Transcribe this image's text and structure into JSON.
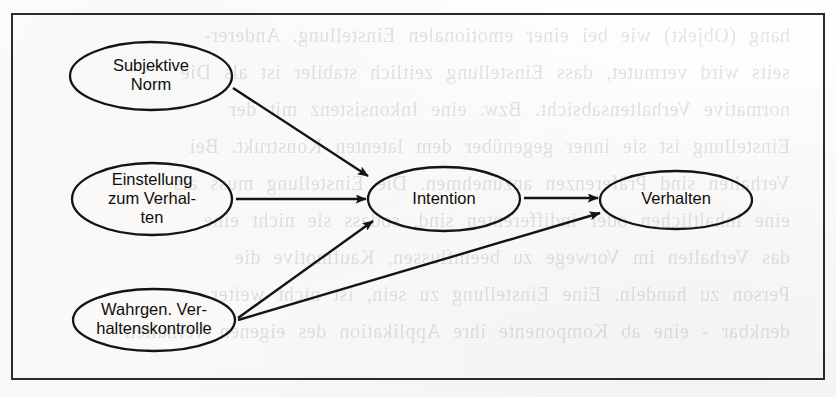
{
  "figure": {
    "kind": "concept-diagram",
    "language": "de",
    "frame": {
      "x": 11,
      "y": 13,
      "width": 814,
      "height": 367,
      "border_color": "#2a2a2a",
      "border_width": 2
    },
    "ink_color": "#141414",
    "paper_color": "#fdfdfc"
  },
  "nodes": [
    {
      "id": "subjektive-norm",
      "lines": [
        "Subjektive",
        "Norm"
      ],
      "cx": 151,
      "cy": 76,
      "rx": 81,
      "ry": 34,
      "label_line_height": 19
    },
    {
      "id": "einstellung",
      "lines": [
        "Einstellung",
        "zum Verhal-",
        "ten"
      ],
      "cx": 152,
      "cy": 199,
      "rx": 80,
      "ry": 36,
      "label_line_height": 19
    },
    {
      "id": "verhaltenskontrolle",
      "lines": [
        "Wahrgen. Ver-",
        "haltenskontrolle"
      ],
      "cx": 154,
      "cy": 320,
      "rx": 81,
      "ry": 31,
      "label_line_height": 19
    },
    {
      "id": "intention",
      "lines": [
        "Intention"
      ],
      "cx": 444,
      "cy": 199,
      "rx": 76,
      "ry": 32,
      "label_line_height": 19
    },
    {
      "id": "verhalten",
      "lines": [
        "Verhalten"
      ],
      "cx": 676,
      "cy": 200,
      "rx": 76,
      "ry": 29,
      "label_line_height": 19
    }
  ],
  "edges": [
    {
      "id": "norm-to-intention",
      "from": "subjektive-norm",
      "to": "intention",
      "x1": 233,
      "y1": 88,
      "x2": 368,
      "y2": 176
    },
    {
      "id": "einstellung-to-intention",
      "from": "einstellung",
      "to": "intention",
      "x1": 236,
      "y1": 199,
      "x2": 366,
      "y2": 199
    },
    {
      "id": "kontrolle-to-intention",
      "from": "verhaltenskontrolle",
      "to": "intention",
      "x1": 238,
      "y1": 318,
      "x2": 373,
      "y2": 221
    },
    {
      "id": "intention-to-verhalten",
      "from": "intention",
      "to": "verhalten",
      "x1": 524,
      "y1": 198,
      "x2": 598,
      "y2": 198
    },
    {
      "id": "kontrolle-to-verhalten",
      "from": "verhaltenskontrolle",
      "to": "verhalten",
      "x1": 238,
      "y1": 320,
      "x2": 600,
      "y2": 213
    }
  ],
  "ghost_text": {
    "note": "faint mirrored show-through from the reverse page",
    "opacity": 0.105,
    "lines": [
      {
        "text": "hang (Objekt) wie bei einer emotionalen Einstellung. Anderer-",
        "x": 46,
        "y": 24
      },
      {
        "text": "seits wird vermutet, dass Einstellung zeitlich stabiler ist als Die",
        "x": 46,
        "y": 61
      },
      {
        "text": "normative Verhaltensabsicht. Bzw. eine Inkonsistenz mit der",
        "x": 46,
        "y": 98
      },
      {
        "text": "Einstellung ist sie inner gegenüber dem latenten Konstrukt. Bei",
        "x": 46,
        "y": 135
      },
      {
        "text": "Verhalten sind Präferenzen anzunehmen. Die Einstellung muss als",
        "x": 46,
        "y": 172
      },
      {
        "text": "eine inhaltlichen oder indifferenten sind, sodass sie nicht eine",
        "x": 46,
        "y": 209
      },
      {
        "text": "das Verhalten im Vorwege zu beeinflussen, Kaufmotive die",
        "x": 46,
        "y": 246
      },
      {
        "text": "Person zu handeln. Eine Einstellung zu sein, ist nicht weiter",
        "x": 46,
        "y": 283
      },
      {
        "text": "denkbar - eine ab Komponente ihre Applikation des eigenen Verhalten",
        "x": 46,
        "y": 320
      }
    ]
  }
}
